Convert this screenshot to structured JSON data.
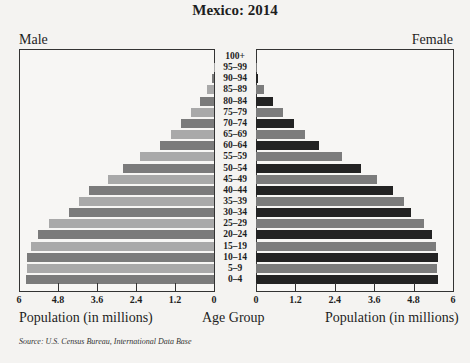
{
  "chart_data": {
    "type": "bar",
    "subtype": "population-pyramid",
    "title": "Mexico: 2014",
    "left_label": "Male",
    "right_label": "Female",
    "center_axis_label": "Age Group",
    "xlabel_left": "Population (in millions)",
    "xlabel_right": "Population (in millions)",
    "xlim": [
      0,
      6
    ],
    "x_ticks": [
      "0",
      "1.2",
      "2.4",
      "3.6",
      "4.8",
      "6"
    ],
    "x_ticks_left": [
      "6",
      "4.8",
      "3.6",
      "2.4",
      "1.2",
      "0"
    ],
    "categories": [
      "100+",
      "95–99",
      "90–94",
      "85–89",
      "80–84",
      "75–79",
      "70–74",
      "65–69",
      "60–64",
      "55–59",
      "50–54",
      "45–49",
      "40–44",
      "35–39",
      "30–34",
      "25–29",
      "20–24",
      "15–19",
      "10–14",
      "5–9",
      "0–4"
    ],
    "series": [
      {
        "name": "Male",
        "values": [
          0.0,
          0.01,
          0.06,
          0.22,
          0.43,
          0.71,
          1.02,
          1.32,
          1.66,
          2.28,
          2.8,
          3.26,
          3.85,
          4.15,
          4.46,
          5.08,
          5.42,
          5.63,
          5.75,
          5.75,
          5.78
        ]
      },
      {
        "name": "Female",
        "values": [
          0.0,
          0.02,
          0.07,
          0.24,
          0.52,
          0.82,
          1.16,
          1.49,
          1.92,
          2.62,
          3.2,
          3.69,
          4.18,
          4.51,
          4.73,
          5.12,
          5.37,
          5.49,
          5.55,
          5.52,
          5.55
        ]
      }
    ],
    "source": "Source: U.S. Census Bureau, International Data Base",
    "grid": false
  },
  "colors": {
    "male_dark": "#7b7b7b",
    "male_light": "#a9a9a9",
    "female_dark": "#232323",
    "female_light": "#7c7c7c"
  }
}
